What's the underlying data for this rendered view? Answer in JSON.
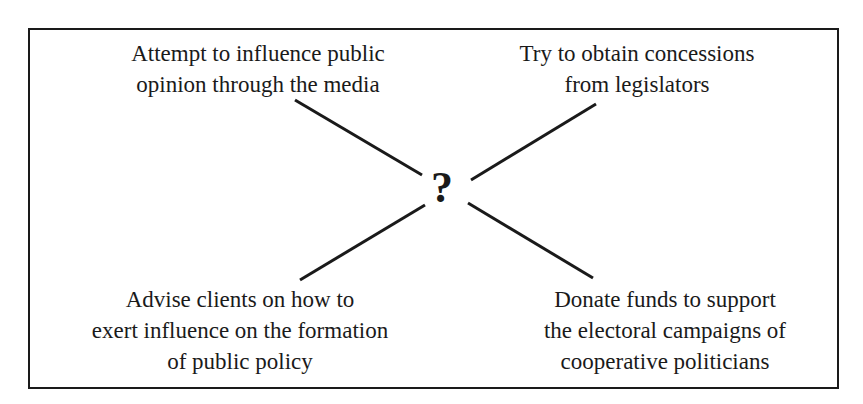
{
  "diagram": {
    "center": {
      "symbol": "?"
    },
    "nodes": [
      {
        "position": "top-left",
        "lines": [
          "Attempt to influence public",
          "opinion through the media"
        ]
      },
      {
        "position": "top-right",
        "lines": [
          "Try to obtain concessions",
          "from legislators"
        ]
      },
      {
        "position": "bottom-left",
        "lines": [
          "Advise clients on how to",
          "exert influence on the formation",
          "of public policy"
        ]
      },
      {
        "position": "bottom-right",
        "lines": [
          "Donate funds to support",
          "the electoral campaigns of",
          "cooperative politicians"
        ]
      }
    ],
    "colors": {
      "line": "#1a1a1a",
      "background": "#ffffff"
    }
  }
}
